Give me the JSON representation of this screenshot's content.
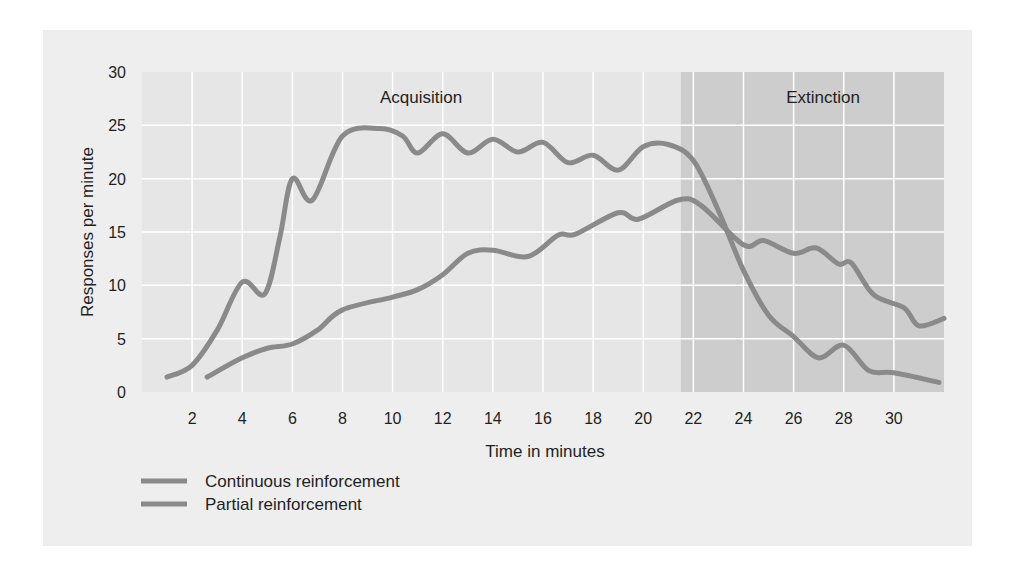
{
  "chart_data": {
    "type": "line",
    "title": "",
    "xlabel": "Time in minutes",
    "ylabel": "Responses per minute",
    "xlim": [
      0,
      32
    ],
    "ylim": [
      0,
      30
    ],
    "x_ticks": [
      2,
      4,
      6,
      8,
      10,
      12,
      14,
      16,
      18,
      20,
      22,
      24,
      26,
      28,
      30
    ],
    "y_ticks": [
      0,
      5,
      10,
      15,
      20,
      25,
      30
    ],
    "grid": true,
    "legend_position": "bottom-left",
    "regions": [
      {
        "label": "Acquisition",
        "x_start": 0,
        "x_end": 21.5,
        "color": "#e6e6e6"
      },
      {
        "label": "Extinction",
        "x_start": 21.5,
        "x_end": 32,
        "color": "#cdcdcd"
      }
    ],
    "series": [
      {
        "name": "Continuous reinforcement",
        "color": "#8a8a8a",
        "points": [
          [
            1,
            1.4
          ],
          [
            2,
            2.5
          ],
          [
            3,
            5.8
          ],
          [
            4,
            10.3
          ],
          [
            4.9,
            9.2
          ],
          [
            5.5,
            14.5
          ],
          [
            6,
            20
          ],
          [
            6.8,
            18
          ],
          [
            8,
            24
          ],
          [
            9.5,
            24.7
          ],
          [
            10.4,
            24
          ],
          [
            11,
            22.4
          ],
          [
            12,
            24.2
          ],
          [
            13,
            22.4
          ],
          [
            14,
            23.7
          ],
          [
            15,
            22.5
          ],
          [
            16,
            23.4
          ],
          [
            17,
            21.5
          ],
          [
            18,
            22.2
          ],
          [
            19,
            20.8
          ],
          [
            20,
            23
          ],
          [
            21,
            23.2
          ],
          [
            22,
            21.7
          ],
          [
            23,
            17
          ],
          [
            24,
            11.4
          ],
          [
            25,
            7.2
          ],
          [
            26,
            5.2
          ],
          [
            27,
            3.2
          ],
          [
            28,
            4.4
          ],
          [
            29,
            2
          ],
          [
            30,
            1.8
          ],
          [
            31.8,
            0.9
          ]
        ]
      },
      {
        "name": "Partial reinforcement",
        "color": "#8a8a8a",
        "points": [
          [
            2.6,
            1.4
          ],
          [
            4,
            3.2
          ],
          [
            5,
            4.1
          ],
          [
            6,
            4.5
          ],
          [
            7,
            5.8
          ],
          [
            8,
            7.7
          ],
          [
            10,
            8.9
          ],
          [
            11,
            9.6
          ],
          [
            12,
            11
          ],
          [
            13,
            13
          ],
          [
            14,
            13.3
          ],
          [
            15.4,
            12.7
          ],
          [
            16.6,
            14.7
          ],
          [
            17.3,
            14.8
          ],
          [
            19,
            16.8
          ],
          [
            19.8,
            16.2
          ],
          [
            21.4,
            18
          ],
          [
            22.3,
            17.5
          ],
          [
            24,
            13.8
          ],
          [
            24.8,
            14.2
          ],
          [
            26,
            13
          ],
          [
            26.9,
            13.5
          ],
          [
            27.8,
            12
          ],
          [
            28.3,
            12.1
          ],
          [
            29.2,
            9.1
          ],
          [
            30.4,
            7.9
          ],
          [
            31,
            6.2
          ],
          [
            32,
            6.9
          ]
        ]
      }
    ]
  },
  "labels": {
    "acquisition": "Acquisition",
    "extinction": "Extinction",
    "xlabel": "Time in minutes",
    "ylabel": "Responses per minute",
    "legend": [
      "Continuous reinforcement",
      "Partial reinforcement"
    ]
  }
}
